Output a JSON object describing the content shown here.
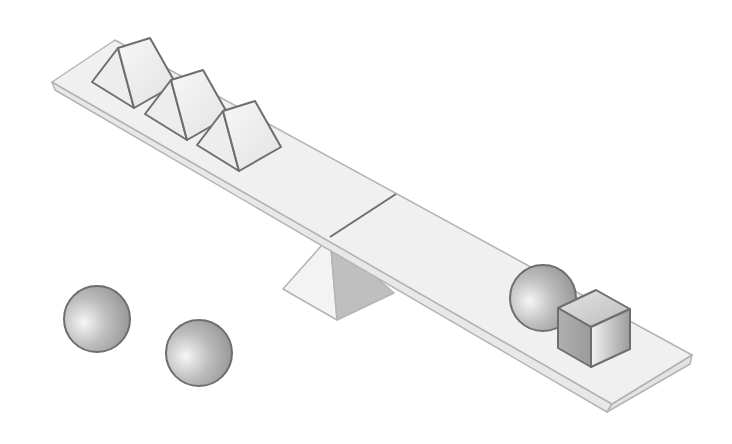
{
  "colors": {
    "background": "#ffffff",
    "plank_top": "#f0f0f0",
    "plank_side": "#e6e6e6",
    "outline": "#6e6e6e",
    "plank_outline": "#b4b4b4",
    "fulcrum_light": "#f2f2f2",
    "fulcrum_dark": "#bdbdbd",
    "shape_light": "#f4f4f4",
    "shape_dark": "#9a9a9a"
  },
  "scene": {
    "left_side_objects": [
      {
        "type": "triangular-prism"
      },
      {
        "type": "triangular-prism"
      },
      {
        "type": "triangular-prism"
      }
    ],
    "right_side_objects": [
      {
        "type": "sphere"
      },
      {
        "type": "cube"
      }
    ],
    "loose_objects": [
      {
        "type": "sphere"
      },
      {
        "type": "sphere"
      }
    ],
    "tilt": "left side raised, right side lowered"
  }
}
